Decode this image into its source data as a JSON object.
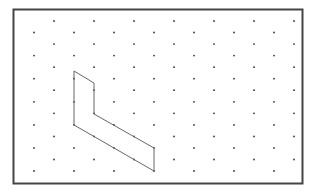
{
  "diagram": {
    "type": "isometric-dot-grid",
    "grid": {
      "rows": 14,
      "dots_per_row_even": 7,
      "dots_per_row_odd": 7,
      "dot_color": "#333333"
    },
    "frame": {
      "border_color": "#444444"
    },
    "shape": {
      "name": "L-shaped polygon",
      "stroke_color": "#666666",
      "vertex_count": 6
    }
  }
}
